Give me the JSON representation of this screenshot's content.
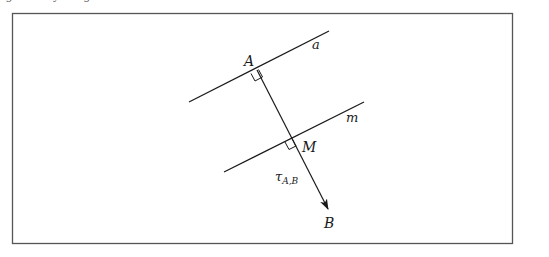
{
  "caption_fragment": "ig... ...y ...g ...",
  "figure": {
    "frame": {
      "x": 12,
      "y": 13,
      "width": 500,
      "height": 230,
      "stroke": "#555555"
    },
    "line_a": {
      "label": "a",
      "x1": 189,
      "y1": 102,
      "x2": 329,
      "y2": 31
    },
    "line_m": {
      "label": "m",
      "x1": 224,
      "y1": 172,
      "x2": 364,
      "y2": 102
    },
    "points": {
      "A": {
        "label": "A",
        "x": 253,
        "y": 70
      },
      "M": {
        "label": "M",
        "x": 293,
        "y": 137
      },
      "B": {
        "label": "B",
        "x": 329,
        "y": 211
      }
    },
    "vector": {
      "label_main": "τ",
      "label_sub": "A,B",
      "from": "A",
      "to": "B"
    },
    "line_color": "#1a1a1a"
  }
}
